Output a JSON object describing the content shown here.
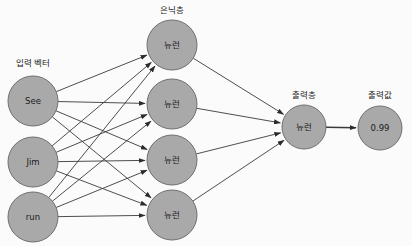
{
  "diagram": {
    "background_color": "#fbfbfb",
    "node_fill": "#a9a9a9",
    "node_stroke": "#6f6f6f",
    "edge_color": "#3a3a3a",
    "text_color": "#1a1a1a"
  },
  "layer_labels": {
    "input": "입력 벡터",
    "hidden": "은닉층",
    "output": "출력층",
    "output_value": "출력값"
  },
  "nodes": {
    "input": [
      {
        "label": "See",
        "cx": 33,
        "cy": 101,
        "r": 25
      },
      {
        "label": "Jim",
        "cx": 33,
        "cy": 162,
        "r": 25
      },
      {
        "label": "run",
        "cx": 33,
        "cy": 217,
        "r": 25
      }
    ],
    "hidden": [
      {
        "label": "뉴런",
        "cx": 172,
        "cy": 45,
        "r": 25
      },
      {
        "label": "뉴런",
        "cx": 172,
        "cy": 104,
        "r": 25
      },
      {
        "label": "뉴런",
        "cx": 172,
        "cy": 160,
        "r": 25
      },
      {
        "label": "뉴런",
        "cx": 172,
        "cy": 215,
        "r": 25
      }
    ],
    "output": [
      {
        "label": "뉴런",
        "cx": 304,
        "cy": 127,
        "r": 22
      }
    ],
    "output_value": [
      {
        "label": "0.99",
        "cx": 380,
        "cy": 128,
        "r": 22
      }
    ]
  },
  "label_positions": {
    "input": {
      "x": 33,
      "y": 63
    },
    "hidden": {
      "x": 172,
      "y": 10
    },
    "output": {
      "x": 304,
      "y": 95
    },
    "output_value": {
      "x": 380,
      "y": 95
    }
  },
  "edges": {
    "input_to_hidden_count": 12,
    "hidden_to_output_count": 4,
    "output_to_value_count": 1
  }
}
